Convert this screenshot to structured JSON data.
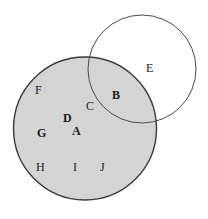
{
  "figure": {
    "type": "venn-diagram",
    "background_color": "#ffffff",
    "width": 208,
    "height": 219
  },
  "circles": [
    {
      "id": "shaded-circle",
      "name": "large-shaded-circle",
      "cx": 85,
      "cy": 128.5,
      "r": 71.5,
      "fill_color": "#d4d4d4",
      "stroke_color": "#3a3a3a",
      "stroke_width": 1.4,
      "filled": true
    },
    {
      "id": "open-circle",
      "name": "small-open-circle",
      "cx": 142,
      "cy": 69,
      "r": 54,
      "fill_color": "none",
      "stroke_color": "#4a4a4a",
      "stroke_width": 1.0,
      "filled": false
    }
  ],
  "labels": [
    {
      "text": "F",
      "x": 35,
      "y": 84,
      "bold": false,
      "region": "shaded-only"
    },
    {
      "text": "C",
      "x": 86,
      "y": 100,
      "bold": false,
      "region": "shaded-only"
    },
    {
      "text": "B",
      "x": 112,
      "y": 89,
      "bold": true,
      "region": "intersection"
    },
    {
      "text": "E",
      "x": 146,
      "y": 62,
      "bold": false,
      "region": "open-only"
    },
    {
      "text": "D",
      "x": 63,
      "y": 112,
      "bold": true,
      "region": "shaded-only"
    },
    {
      "text": "G",
      "x": 37,
      "y": 127,
      "bold": true,
      "region": "shaded-only"
    },
    {
      "text": "A",
      "x": 72,
      "y": 125,
      "bold": true,
      "region": "shaded-only"
    },
    {
      "text": "H",
      "x": 36,
      "y": 161,
      "bold": false,
      "region": "shaded-only"
    },
    {
      "text": "I",
      "x": 73,
      "y": 161,
      "bold": false,
      "region": "shaded-only"
    },
    {
      "text": "J",
      "x": 100,
      "y": 161,
      "bold": false,
      "region": "shaded-only"
    }
  ]
}
